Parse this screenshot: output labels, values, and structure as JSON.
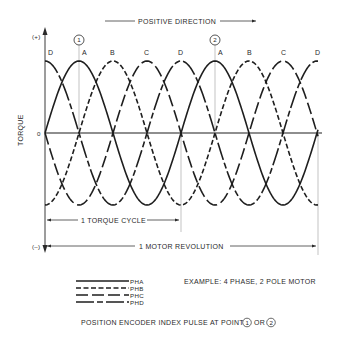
{
  "header": {
    "direction_label": "POSITIVE DIRECTION"
  },
  "axis": {
    "y_label": "TORQUE",
    "plus_label": "(+)",
    "zero_label": "0",
    "minus_label": "(–)"
  },
  "markers": [
    {
      "id": "1",
      "label": "1"
    },
    {
      "id": "2",
      "label": "2"
    }
  ],
  "peak_labels": [
    "D",
    "A",
    "B",
    "C",
    "D",
    "A",
    "B",
    "C",
    "D"
  ],
  "spans": {
    "torque_cycle": "1 TORQUE CYCLE",
    "motor_revolution": "1 MOTOR REVOLUTION"
  },
  "legend": {
    "items": [
      {
        "name": "PHA",
        "style": "solid"
      },
      {
        "name": "PHB",
        "style": "dashed"
      },
      {
        "name": "PHC",
        "style": "long-dash"
      },
      {
        "name": "PHD",
        "style": "dash-dot-long"
      }
    ],
    "example": "EXAMPLE: 4 PHASE, 2 POLE MOTOR"
  },
  "footer": {
    "text_prefix": "POSITION ENCODER INDEX PULSE AT POINTS",
    "text_or": "OR",
    "point_1": "1",
    "point_2": "2"
  },
  "chart_data": {
    "type": "line",
    "title": "",
    "xlabel": "Rotor position (positive direction)",
    "ylabel": "TORQUE",
    "ylim": [
      "(–)",
      "(+)"
    ],
    "torque_cycles_per_revolution": 2,
    "series": [
      {
        "name": "PHA",
        "style": "solid",
        "peaks_at": [
          "A"
        ]
      },
      {
        "name": "PHB",
        "style": "dashed",
        "peaks_at": [
          "B"
        ]
      },
      {
        "name": "PHC",
        "style": "long-dash",
        "peaks_at": [
          "C"
        ]
      },
      {
        "name": "PHD",
        "style": "dash-dot-long",
        "peaks_at": [
          "D"
        ]
      }
    ],
    "peak_sequence": [
      "D",
      "A",
      "B",
      "C",
      "D",
      "A",
      "B",
      "C",
      "D"
    ],
    "index_pulse_points": [
      "1 (at peak A, first cycle)",
      "2 (at peak A, second cycle)"
    ]
  }
}
